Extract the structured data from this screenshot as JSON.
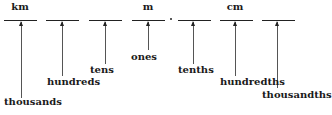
{
  "diagram": {
    "units": [
      {
        "label": "km",
        "x": 20
      },
      {
        "label": "m",
        "x": 148
      },
      {
        "label": "cm",
        "x": 235
      }
    ],
    "slots": [
      {
        "x": 4
      },
      {
        "x": 46
      },
      {
        "x": 89
      },
      {
        "x": 132
      },
      {
        "x": 178
      },
      {
        "x": 220
      },
      {
        "x": 262
      }
    ],
    "decimal_point": {
      "x": 170
    },
    "place_values": [
      {
        "label": "thousands",
        "arrow_x": 21,
        "arrow_bottom": 100,
        "label_x": 4,
        "label_y": 98
      },
      {
        "label": "hundreds",
        "arrow_x": 62,
        "arrow_bottom": 76,
        "label_x": 47,
        "label_y": 78
      },
      {
        "label": "tens",
        "arrow_x": 105,
        "arrow_bottom": 63,
        "label_x": 90,
        "label_y": 66
      },
      {
        "label": "ones",
        "arrow_x": 148,
        "arrow_bottom": 52,
        "label_x": 131,
        "label_y": 53
      },
      {
        "label": "tenths",
        "arrow_x": 193,
        "arrow_bottom": 62,
        "label_x": 178,
        "label_y": 66
      },
      {
        "label": "hundredths",
        "arrow_x": 235,
        "arrow_bottom": 76,
        "label_x": 220,
        "label_y": 78
      },
      {
        "label": "thousandths",
        "arrow_x": 277,
        "arrow_bottom": 88,
        "label_x": 262,
        "label_y": 91
      }
    ]
  }
}
